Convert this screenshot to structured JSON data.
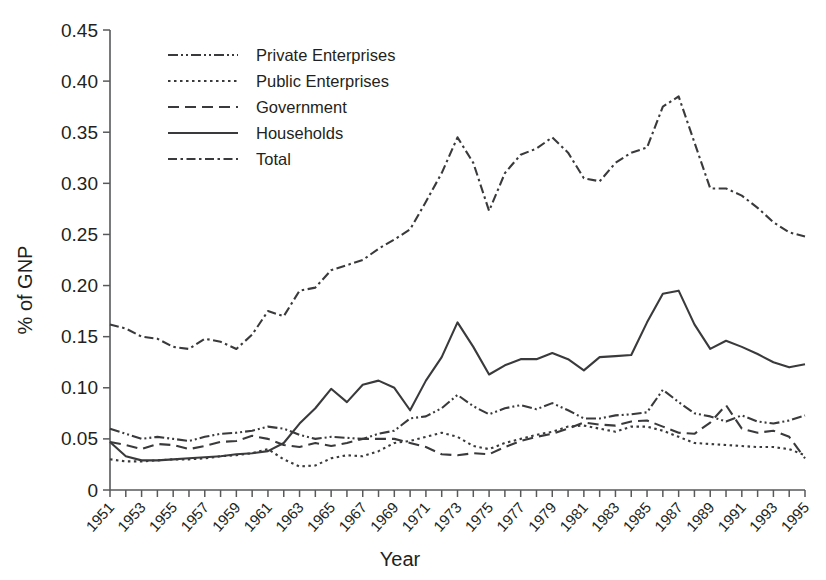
{
  "chart_data": {
    "type": "line",
    "title": "",
    "xlabel": "Year",
    "ylabel": "% of GNP",
    "xlim": [
      1951,
      1995
    ],
    "ylim": [
      0,
      0.45
    ],
    "grid": false,
    "legend_position": "top-left",
    "ytick_labels": [
      "0",
      "0.05",
      "0.10",
      "0.15",
      "0.20",
      "0.25",
      "0.30",
      "0.35",
      "0.40",
      "0.45"
    ],
    "ytick_values": [
      0,
      0.05,
      0.1,
      0.15,
      0.2,
      0.25,
      0.3,
      0.35,
      0.4,
      0.45
    ],
    "xtick_labels": [
      "1951",
      "1953",
      "1955",
      "1957",
      "1959",
      "1961",
      "1963",
      "1965",
      "1967",
      "1969",
      "1971",
      "1973",
      "1975",
      "1977",
      "1979",
      "1981",
      "1983",
      "1985",
      "1987",
      "1989",
      "1991",
      "1993",
      "1995"
    ],
    "x": [
      1951,
      1952,
      1953,
      1954,
      1955,
      1956,
      1957,
      1958,
      1959,
      1960,
      1961,
      1962,
      1963,
      1964,
      1965,
      1966,
      1967,
      1968,
      1969,
      1970,
      1971,
      1972,
      1973,
      1974,
      1975,
      1976,
      1977,
      1978,
      1979,
      1980,
      1981,
      1982,
      1983,
      1984,
      1985,
      1986,
      1987,
      1988,
      1989,
      1990,
      1991,
      1992,
      1993,
      1994,
      1995
    ],
    "series": [
      {
        "name": "Private Enterprises",
        "dash": "10,3,2,3,2,3",
        "values": [
          0.06,
          0.055,
          0.05,
          0.052,
          0.05,
          0.048,
          0.052,
          0.055,
          0.056,
          0.058,
          0.062,
          0.06,
          0.054,
          0.05,
          0.052,
          0.051,
          0.05,
          0.055,
          0.058,
          0.07,
          0.072,
          0.08,
          0.093,
          0.082,
          0.074,
          0.08,
          0.083,
          0.079,
          0.085,
          0.078,
          0.07,
          0.07,
          0.073,
          0.074,
          0.076,
          0.098,
          0.086,
          0.075,
          0.072,
          0.067,
          0.073,
          0.067,
          0.065,
          0.068,
          0.073
        ]
      },
      {
        "name": "Public Enterprises",
        "dash": "2.5,3.5",
        "values": [
          0.03,
          0.028,
          0.028,
          0.029,
          0.03,
          0.03,
          0.031,
          0.033,
          0.034,
          0.036,
          0.04,
          0.03,
          0.023,
          0.024,
          0.031,
          0.034,
          0.033,
          0.038,
          0.046,
          0.048,
          0.052,
          0.056,
          0.052,
          0.043,
          0.04,
          0.046,
          0.05,
          0.054,
          0.057,
          0.062,
          0.063,
          0.06,
          0.057,
          0.062,
          0.062,
          0.058,
          0.052,
          0.046,
          0.045,
          0.044,
          0.043,
          0.042,
          0.042,
          0.04,
          0.034
        ]
      },
      {
        "name": "Government",
        "dash": "11,6",
        "values": [
          0.047,
          0.044,
          0.04,
          0.045,
          0.044,
          0.04,
          0.043,
          0.047,
          0.048,
          0.053,
          0.05,
          0.044,
          0.042,
          0.046,
          0.043,
          0.046,
          0.05,
          0.05,
          0.05,
          0.046,
          0.042,
          0.035,
          0.034,
          0.036,
          0.035,
          0.042,
          0.048,
          0.052,
          0.055,
          0.06,
          0.066,
          0.064,
          0.063,
          0.067,
          0.068,
          0.062,
          0.056,
          0.055,
          0.066,
          0.083,
          0.06,
          0.056,
          0.058,
          0.052,
          0.031
        ]
      },
      {
        "name": "Households",
        "dash": "",
        "values": [
          0.047,
          0.033,
          0.029,
          0.029,
          0.03,
          0.031,
          0.032,
          0.033,
          0.035,
          0.036,
          0.038,
          0.046,
          0.065,
          0.08,
          0.099,
          0.086,
          0.103,
          0.107,
          0.1,
          0.078,
          0.107,
          0.13,
          0.164,
          0.14,
          0.113,
          0.122,
          0.128,
          0.128,
          0.134,
          0.128,
          0.117,
          0.13,
          0.131,
          0.132,
          0.164,
          0.192,
          0.195,
          0.162,
          0.138,
          0.146,
          0.14,
          0.133,
          0.125,
          0.12,
          0.123
        ]
      },
      {
        "name": "Total",
        "dash": "9,3.5,2.5,3.5",
        "values": [
          0.162,
          0.158,
          0.15,
          0.148,
          0.14,
          0.138,
          0.148,
          0.145,
          0.138,
          0.152,
          0.175,
          0.17,
          0.195,
          0.198,
          0.215,
          0.22,
          0.225,
          0.236,
          0.245,
          0.255,
          0.282,
          0.31,
          0.345,
          0.32,
          0.273,
          0.31,
          0.328,
          0.334,
          0.345,
          0.33,
          0.305,
          0.302,
          0.32,
          0.33,
          0.335,
          0.375,
          0.385,
          0.34,
          0.295,
          0.295,
          0.288,
          0.276,
          0.262,
          0.252,
          0.248
        ]
      }
    ]
  }
}
